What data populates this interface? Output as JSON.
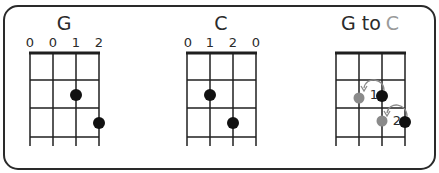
{
  "chords": [
    {
      "name": "G",
      "string_labels": [
        "0",
        "0",
        "1",
        "2"
      ],
      "dots": [
        {
          "string": 3,
          "fret": 1
        },
        {
          "string": 4,
          "fret": 2
        }
      ]
    },
    {
      "name": "C",
      "string_labels": [
        "0",
        "1",
        "2",
        "0"
      ],
      "dots": [
        {
          "string": 2,
          "fret": 1
        },
        {
          "string": 3,
          "fret": 2
        }
      ]
    }
  ],
  "transition": {
    "title_from": "G to",
    "title_to": "C",
    "moves": [
      {
        "label": "1",
        "from": {
          "string": 3,
          "fret": 1
        },
        "to": {
          "string": 2,
          "fret": 1
        }
      },
      {
        "label": "2",
        "from": {
          "string": 4,
          "fret": 2
        },
        "to": {
          "string": 3,
          "fret": 2
        }
      }
    ]
  },
  "colors": {
    "ink": "#1a1a1a",
    "target_dot": "#8a8a8a",
    "title_to": "#9a9a9a"
  }
}
